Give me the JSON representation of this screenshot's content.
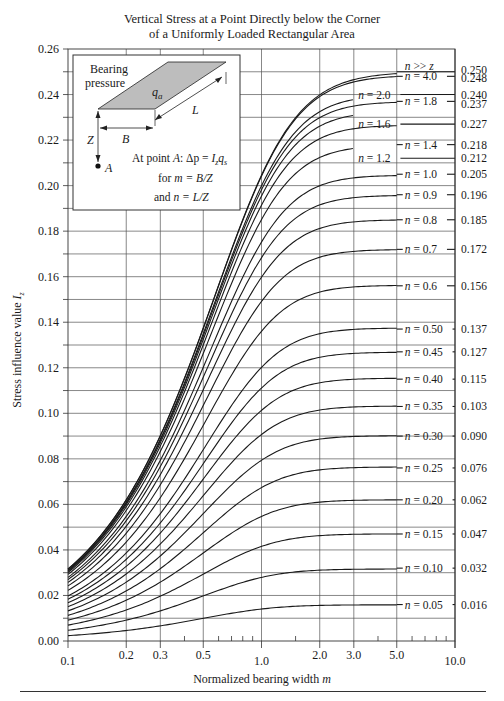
{
  "chart_data": {
    "type": "line",
    "title_lines": [
      "Vertical Stress at a Point Directly below the Corner",
      "of a Uniformly Loaded Rectangular Area"
    ],
    "xlabel": "Normalized bearing width m",
    "ylabel": "Stress influence value I_z",
    "x_scale": "log",
    "xlim": [
      0.1,
      10.0
    ],
    "ylim": [
      0.0,
      0.26
    ],
    "x_ticks": [
      0.1,
      0.2,
      0.3,
      0.5,
      1.0,
      2.0,
      3.0,
      5.0,
      10.0
    ],
    "x_tick_labels": [
      "0.1",
      "0.2",
      "0.3",
      "0.5",
      "1.0",
      "2.0",
      "3.0",
      "5.0",
      "10.0"
    ],
    "y_ticks": [
      0.0,
      0.02,
      0.04,
      0.06,
      0.08,
      0.1,
      0.12,
      0.14,
      0.16,
      0.18,
      0.2,
      0.22,
      0.24,
      0.26
    ],
    "y_tick_labels": [
      "0.00",
      "0.02",
      "0.04",
      "0.06",
      "0.08",
      "0.10",
      "0.12",
      "0.14",
      "0.16",
      "0.18",
      "0.20",
      "0.22",
      "0.24",
      "0.26"
    ],
    "grid": true,
    "series": [
      {
        "name": "n >> z",
        "n": 1000,
        "asymptote": 0.25,
        "label_pos": "right"
      },
      {
        "name": "n = 4.0",
        "n": 4.0,
        "asymptote": 0.248,
        "label_pos": "right"
      },
      {
        "name": "n = 2.0",
        "n": 2.0,
        "asymptote": 0.24,
        "label_pos": "inside"
      },
      {
        "name": "n = 1.8",
        "n": 1.8,
        "asymptote": 0.237,
        "label_pos": "right"
      },
      {
        "name": "n = 1.6",
        "n": 1.6,
        "asymptote": 0.227,
        "label_pos": "inside"
      },
      {
        "name": "n = 1.4",
        "n": 1.4,
        "asymptote": 0.218,
        "label_pos": "right"
      },
      {
        "name": "n = 1.2",
        "n": 1.2,
        "asymptote": 0.212,
        "label_pos": "inside"
      },
      {
        "name": "n = 1.0",
        "n": 1.0,
        "asymptote": 0.205,
        "label_pos": "right"
      },
      {
        "name": "n = 0.9",
        "n": 0.9,
        "asymptote": 0.196,
        "label_pos": "right"
      },
      {
        "name": "n = 0.8",
        "n": 0.8,
        "asymptote": 0.185,
        "label_pos": "right"
      },
      {
        "name": "n = 0.7",
        "n": 0.7,
        "asymptote": 0.172,
        "label_pos": "right"
      },
      {
        "name": "n = 0.6",
        "n": 0.6,
        "asymptote": 0.156,
        "label_pos": "right"
      },
      {
        "name": "n = 0.50",
        "n": 0.5,
        "asymptote": 0.137,
        "label_pos": "right"
      },
      {
        "name": "n = 0.45",
        "n": 0.45,
        "asymptote": 0.127,
        "label_pos": "right"
      },
      {
        "name": "n = 0.40",
        "n": 0.4,
        "asymptote": 0.115,
        "label_pos": "right"
      },
      {
        "name": "n = 0.35",
        "n": 0.35,
        "asymptote": 0.103,
        "label_pos": "right"
      },
      {
        "name": "n = 0.30",
        "n": 0.3,
        "asymptote": 0.09,
        "label_pos": "right"
      },
      {
        "name": "n = 0.25",
        "n": 0.25,
        "asymptote": 0.076,
        "label_pos": "right"
      },
      {
        "name": "n = 0.20",
        "n": 0.2,
        "asymptote": 0.062,
        "label_pos": "right"
      },
      {
        "name": "n = 0.15",
        "n": 0.15,
        "asymptote": 0.047,
        "label_pos": "right"
      },
      {
        "name": "n = 0.10",
        "n": 0.1,
        "asymptote": 0.032,
        "label_pos": "right"
      },
      {
        "name": "n = 0.05",
        "n": 0.05,
        "asymptote": 0.016,
        "label_pos": "right"
      }
    ],
    "right_axis_values": [
      "0.250",
      "0.248",
      "0.240",
      "0.237",
      "0.227",
      "0.218",
      "0.212",
      "0.205",
      "0.196",
      "0.185",
      "0.172",
      "0.156",
      "0.137",
      "0.127",
      "0.115",
      "0.103",
      "0.090",
      "0.076",
      "0.062",
      "0.047",
      "0.032",
      "0.016"
    ]
  },
  "inset": {
    "bearing_label_1": "Bearing",
    "bearing_label_2": "pressure",
    "load_symbol": "q",
    "load_subscript": "a",
    "dim_L": "L",
    "dim_B": "B",
    "dim_Z": "Z",
    "point_A": "A",
    "equation": "At point A: Δp = I_z q_s",
    "eq_prefix": "At point ",
    "eq_A": "A",
    "eq_mid": ": Δp = ",
    "eq_I": "I",
    "eq_Isub": "z",
    "eq_q": "q",
    "eq_qsub": "s",
    "m_def_prefix": "for ",
    "m_def": "m = B/Z",
    "n_def_prefix": "and ",
    "n_def": "n = L/Z"
  }
}
